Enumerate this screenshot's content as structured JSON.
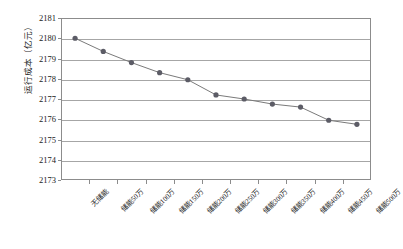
{
  "chart_data": {
    "type": "line",
    "title": "",
    "xlabel": "",
    "ylabel": "运行成本（亿元）",
    "ylim": [
      2173,
      2181
    ],
    "ytick_step": 1,
    "grid": "horizontal",
    "legend": "none",
    "marker": "circle",
    "line_color": "#7a7a7a",
    "marker_color": "#5c5c66",
    "categories": [
      "无储能",
      "储能50万",
      "储能100万",
      "储能150万",
      "储能200万",
      "储能250万",
      "储能300万",
      "储能350万",
      "储能400万",
      "储能450万",
      "储能500万"
    ],
    "values": [
      2180.0,
      2179.35,
      2178.8,
      2178.3,
      2177.95,
      2177.2,
      2177.0,
      2176.75,
      2176.6,
      2175.95,
      2175.75
    ],
    "yticks": [
      2181,
      2180,
      2179,
      2178,
      2177,
      2176,
      2175,
      2174,
      2173
    ],
    "ytick_labels": [
      "2181",
      "2180",
      "2179",
      "2178",
      "2177",
      "2176",
      "2175",
      "2174",
      "2173"
    ]
  }
}
